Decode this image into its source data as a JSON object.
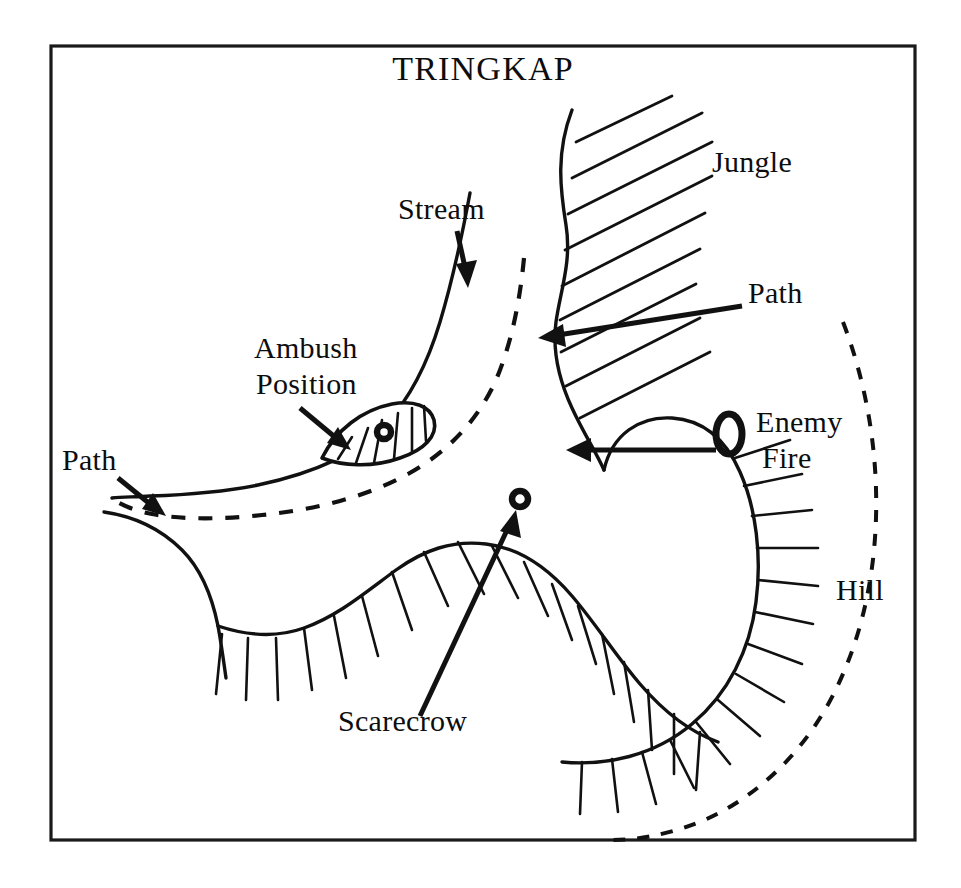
{
  "map": {
    "title": "TRINGKAP",
    "frame": {
      "x": 51,
      "y": 46,
      "width": 864,
      "height": 794
    },
    "labels": [
      {
        "id": "jungle",
        "text": "Jungle",
        "x": 712,
        "y": 172,
        "anchor": "start"
      },
      {
        "id": "stream",
        "text": "Stream",
        "x": 398,
        "y": 219,
        "anchor": "start"
      },
      {
        "id": "path-right",
        "text": "Path",
        "x": 748,
        "y": 303,
        "anchor": "start"
      },
      {
        "id": "ambush-1",
        "text": "Ambush",
        "x": 254,
        "y": 358,
        "anchor": "start"
      },
      {
        "id": "ambush-2",
        "text": "Position",
        "x": 256,
        "y": 394,
        "anchor": "start"
      },
      {
        "id": "enemy-1",
        "text": "Enemy",
        "x": 756,
        "y": 432,
        "anchor": "start"
      },
      {
        "id": "enemy-2",
        "text": "Fire",
        "x": 762,
        "y": 468,
        "anchor": "start"
      },
      {
        "id": "path-left",
        "text": "Path",
        "x": 62,
        "y": 470,
        "anchor": "start"
      },
      {
        "id": "hill",
        "text": "Hill",
        "x": 836,
        "y": 600,
        "anchor": "start"
      },
      {
        "id": "scarecrow",
        "text": "Scarecrow",
        "x": 338,
        "y": 731,
        "anchor": "start"
      }
    ],
    "features": {
      "stream": {
        "name": "stream",
        "kind": "solid-curve"
      },
      "path_dashed": {
        "name": "path",
        "kind": "dashed-curve"
      },
      "jungle": {
        "name": "jungle",
        "kind": "hatched-area"
      },
      "hill_main": {
        "name": "hill",
        "kind": "hachured-ridge"
      },
      "hill_ridge_left": {
        "name": "hill-ridge-left",
        "kind": "hachured-ridge"
      },
      "hill_contour_dashed": {
        "name": "hill-contour",
        "kind": "dashed-arc"
      },
      "ambush_position": {
        "name": "ambush-position",
        "kind": "hatched-lens"
      },
      "enemy_fire": {
        "name": "enemy-fire",
        "kind": "ring-marker"
      },
      "scarecrow": {
        "name": "scarecrow",
        "kind": "ring-marker"
      }
    },
    "colors": {
      "ink": "#111111",
      "paper": "#ffffff",
      "frame": "#1a1a1a"
    }
  }
}
